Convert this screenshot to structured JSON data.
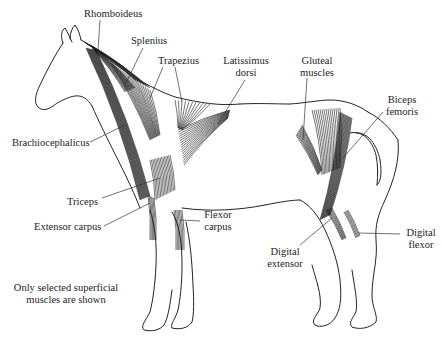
{
  "diagram": {
    "labels": [
      {
        "id": "rhomboideus",
        "lines": [
          "Rhomboideus"
        ]
      },
      {
        "id": "splenius",
        "lines": [
          "Splenius"
        ]
      },
      {
        "id": "trapezius",
        "lines": [
          "Trapezius"
        ]
      },
      {
        "id": "latissimus-dorsi",
        "lines": [
          "Latissimus",
          "dorsi"
        ]
      },
      {
        "id": "gluteal-muscles",
        "lines": [
          "Gluteal",
          "muscles"
        ]
      },
      {
        "id": "biceps-femoris",
        "lines": [
          "Biceps",
          "femoris"
        ]
      },
      {
        "id": "brachiocephalicus",
        "lines": [
          "Brachiocephalicus"
        ]
      },
      {
        "id": "triceps",
        "lines": [
          "Triceps"
        ]
      },
      {
        "id": "extensor-carpus",
        "lines": [
          "Extensor carpus"
        ]
      },
      {
        "id": "flexor-carpus",
        "lines": [
          "Flexor",
          "carpus"
        ]
      },
      {
        "id": "digital-extensor",
        "lines": [
          "Digital",
          "extensor"
        ]
      },
      {
        "id": "digital-flexor",
        "lines": [
          "Digital",
          "flexor"
        ]
      }
    ],
    "note": [
      "Only selected superficial",
      "muscles are shown"
    ]
  }
}
